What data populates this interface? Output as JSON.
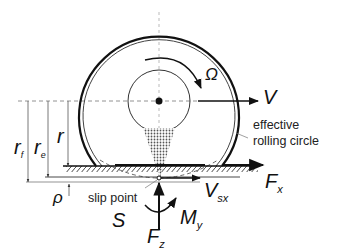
{
  "diagram": {
    "title": "",
    "labels": {
      "omega": "Ω",
      "v": "V",
      "effective_line1": "effective",
      "effective_line2": "rolling circle",
      "r_f": "r",
      "r_f_sub": "f",
      "r_e": "r",
      "r_e_sub": "e",
      "r": "r",
      "rho": "ρ",
      "slip_point": "slip point",
      "s": "S",
      "f_x": "F",
      "f_x_sub": "x",
      "v_sx": "V",
      "v_sx_sub": "sx",
      "f_z": "F",
      "f_z_sub": "z",
      "m_y": "M",
      "m_y_sub": "y"
    },
    "colors": {
      "stroke": "#111111",
      "thin_stroke": "#555555",
      "dashed": "#888888",
      "contact_fill": "#9a9a9a"
    }
  }
}
